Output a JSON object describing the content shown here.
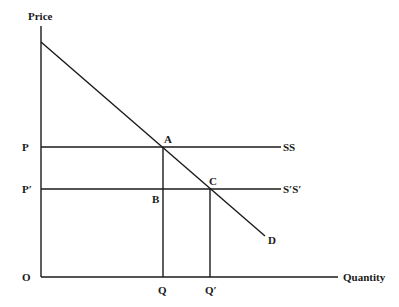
{
  "diagram": {
    "axes": {
      "y_label": "Price",
      "x_label": "Quantity",
      "origin_label": "O"
    },
    "price_labels": [
      {
        "label": "P",
        "y": 147
      },
      {
        "label": "P′",
        "y": 189
      }
    ],
    "quantity_labels": [
      {
        "label": "Q",
        "x": 163
      },
      {
        "label": "Q′",
        "x": 210
      }
    ],
    "curves": {
      "demand": {
        "label": "D",
        "from": [
          41,
          42
        ],
        "to": [
          265,
          236
        ]
      },
      "supply_1": {
        "label": "SS",
        "y": 147
      },
      "supply_2": {
        "label": "S′S′",
        "y": 189
      }
    },
    "points": [
      {
        "label": "A",
        "x": 163,
        "y": 147
      },
      {
        "label": "B",
        "x": 163,
        "y": 189
      },
      {
        "label": "C",
        "x": 210,
        "y": 189
      }
    ],
    "text": {
      "price": "Price",
      "quantity": "Quantity",
      "origin": "O",
      "p": "P",
      "p_prime": "P′",
      "q": "Q",
      "q_prime": "Q′",
      "ss": "SS",
      "s_prime_s_prime": "S′S′",
      "d": "D",
      "a": "A",
      "b": "B",
      "c": "C"
    }
  }
}
